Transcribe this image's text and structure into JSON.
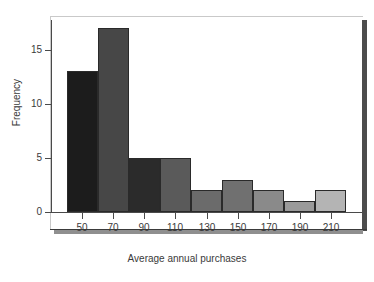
{
  "chart_data": {
    "type": "bar",
    "subtype": "histogram",
    "title": "",
    "xlabel": "Average annual purchases",
    "ylabel": "Frequency",
    "categories": [
      "50",
      "70",
      "90",
      "110",
      "130",
      "150",
      "170",
      "190",
      "210"
    ],
    "values": [
      13,
      17,
      5,
      5,
      2,
      3,
      2,
      1,
      2
    ],
    "bin_edges": [
      40,
      60,
      80,
      100,
      120,
      140,
      160,
      180,
      200,
      220
    ],
    "bin_width": 20,
    "xlim": [
      30,
      230
    ],
    "ylim": [
      0,
      18
    ],
    "yticks": [
      0,
      5,
      10,
      15
    ],
    "ytick_labels": [
      "0",
      "5",
      "10",
      "15"
    ],
    "xticks": [
      50,
      70,
      90,
      110,
      130,
      150,
      170,
      190,
      210
    ],
    "xtick_labels": [
      "50",
      "70",
      "90",
      "110",
      "130",
      "150",
      "170",
      "190",
      "210"
    ],
    "grid": false,
    "legend": false,
    "bar_colors": [
      "#1c1c1c",
      "#474747",
      "#2b2b2b",
      "#5a5a5a",
      "#6b6b6b",
      "#707070",
      "#8a8a8a",
      "#9a9a9a",
      "#b4b4b4"
    ],
    "bar_edge_color": "#2a2a2a",
    "axis_color": "#4a4a4a",
    "text_color": "#3a3a3a",
    "background_color": "#ffffff",
    "frame_shadow_color": "#4c4c4c"
  }
}
